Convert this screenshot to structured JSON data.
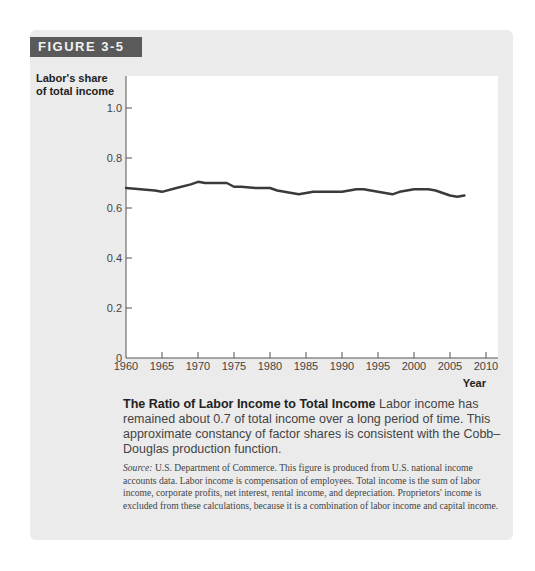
{
  "figure": {
    "badge": "FIGURE 3-5",
    "y_axis_label_line1": "Labor's share",
    "y_axis_label_line2": "of total income",
    "x_axis_label": "Year",
    "caption_title": "The Ratio of Labor Income to Total Income",
    "caption_body": " Labor income has remained about 0.7 of total income over a long period of time. This approximate constancy of factor shares is consistent with the Cobb–Douglas production function.",
    "source_label": "Source:",
    "source_text": " U.S. Department of Commerce. This figure is produced from U.S. national income accounts data. Labor income is compensation of employees. Total income is the sum of labor income, corporate profits, net interest, rental income, and depreciation. Proprietors' income is excluded from these calculations, because it is a combination of labor income and capital income."
  },
  "colors": {
    "badge_bg": "#5a5a5a",
    "card_bg": "#ebebeb",
    "line": "#3a3a3a"
  },
  "chart_data": {
    "type": "line",
    "title": "The Ratio of Labor Income to Total Income",
    "xlabel": "Year",
    "ylabel": "Labor's share of total income",
    "xlim": [
      1960,
      2010
    ],
    "ylim": [
      0,
      1.0
    ],
    "x_ticks": [
      "1960",
      "1965",
      "1970",
      "1975",
      "1980",
      "1985",
      "1990",
      "1995",
      "2000",
      "2005",
      "2010"
    ],
    "y_ticks": [
      "0",
      "0.2",
      "0.4",
      "0.6",
      "0.8",
      "1.0"
    ],
    "grid": false,
    "legend": null,
    "series": [
      {
        "name": "Labor's share",
        "x": [
          1960,
          1962,
          1964,
          1965,
          1967,
          1969,
          1970,
          1971,
          1973,
          1974,
          1975,
          1976,
          1978,
          1980,
          1981,
          1983,
          1984,
          1985,
          1986,
          1988,
          1990,
          1991,
          1992,
          1993,
          1995,
          1997,
          1998,
          1999,
          2000,
          2001,
          2002,
          2003,
          2004,
          2005,
          2006,
          2007
        ],
        "values": [
          0.68,
          0.675,
          0.67,
          0.665,
          0.68,
          0.695,
          0.705,
          0.7,
          0.7,
          0.7,
          0.685,
          0.685,
          0.68,
          0.68,
          0.67,
          0.66,
          0.655,
          0.66,
          0.665,
          0.665,
          0.665,
          0.67,
          0.675,
          0.675,
          0.665,
          0.655,
          0.665,
          0.67,
          0.675,
          0.675,
          0.675,
          0.67,
          0.66,
          0.65,
          0.645,
          0.65
        ]
      }
    ]
  }
}
